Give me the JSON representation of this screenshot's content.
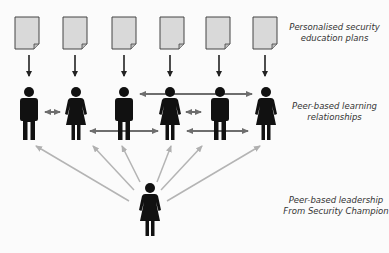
{
  "labels": {
    "plans": [
      "Personalised security",
      "education plans"
    ],
    "relationships": [
      "Peer-based learning",
      "relationships"
    ],
    "leadership": [
      "Peer-based leadership",
      "From Security Champion"
    ]
  },
  "documents": [
    {
      "icon": "document-icon",
      "x": 27
    },
    {
      "icon": "document-icon",
      "x": 75
    },
    {
      "icon": "document-icon",
      "x": 124
    },
    {
      "icon": "document-icon",
      "x": 172
    },
    {
      "icon": "document-icon",
      "x": 218
    },
    {
      "icon": "document-icon",
      "x": 265
    }
  ],
  "people": [
    {
      "icon": "male-person-icon",
      "x": 29
    },
    {
      "icon": "female-person-icon",
      "x": 76
    },
    {
      "icon": "male-person-icon",
      "x": 124
    },
    {
      "icon": "female-person-icon",
      "x": 170
    },
    {
      "icon": "male-person-icon",
      "x": 220
    },
    {
      "icon": "female-person-icon",
      "x": 266
    }
  ],
  "champion": {
    "icon": "female-person-icon",
    "x": 150
  },
  "colors": {
    "figure": "#111111",
    "document_fill": "#d9d9d9",
    "document_stroke": "#444444",
    "down_arrow": "#222222",
    "peer_arrow": "#6e6e6e",
    "leader_arrow": "#b4b4b4",
    "background": "#fbfbfb"
  }
}
